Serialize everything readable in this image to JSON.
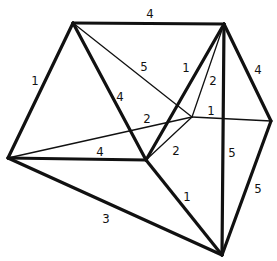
{
  "diagram": {
    "vertices": [
      {
        "id": "A",
        "x": 73,
        "y": 23
      },
      {
        "id": "B",
        "x": 224,
        "y": 24
      },
      {
        "id": "C",
        "x": 8,
        "y": 158
      },
      {
        "id": "D",
        "x": 146,
        "y": 160
      },
      {
        "id": "E",
        "x": 192,
        "y": 117
      },
      {
        "id": "F",
        "x": 271,
        "y": 121
      },
      {
        "id": "G",
        "x": 222,
        "y": 255
      }
    ],
    "edges": [
      {
        "from": "A",
        "to": "B",
        "weight": "4",
        "style": "thick",
        "lx": 150,
        "ly": 18
      },
      {
        "from": "A",
        "to": "C",
        "weight": "1",
        "style": "thick",
        "lx": 35,
        "ly": 85
      },
      {
        "from": "A",
        "to": "D",
        "weight": "4",
        "style": "thick",
        "lx": 120,
        "ly": 101
      },
      {
        "from": "A",
        "to": "E",
        "weight": "5",
        "style": "thin",
        "lx": 144,
        "ly": 71
      },
      {
        "from": "B",
        "to": "D",
        "weight": "1",
        "style": "thick",
        "lx": 186,
        "ly": 72
      },
      {
        "from": "B",
        "to": "E",
        "weight": "2",
        "style": "thin",
        "lx": 213,
        "ly": 85
      },
      {
        "from": "B",
        "to": "F",
        "weight": "4",
        "style": "thick",
        "lx": 258,
        "ly": 74
      },
      {
        "from": "B",
        "to": "G",
        "weight": "5",
        "style": "thick",
        "lx": 232,
        "ly": 157
      },
      {
        "from": "C",
        "to": "E",
        "weight": "2",
        "style": "thin",
        "lx": 147,
        "ly": 123
      },
      {
        "from": "C",
        "to": "D",
        "weight": "4",
        "style": "thick",
        "lx": 100,
        "ly": 156
      },
      {
        "from": "C",
        "to": "G",
        "weight": "3",
        "style": "thick",
        "lx": 106,
        "ly": 223
      },
      {
        "from": "D",
        "to": "E",
        "weight": "2",
        "style": "thin",
        "lx": 176,
        "ly": 155
      },
      {
        "from": "D",
        "to": "G",
        "weight": "1",
        "style": "thick",
        "lx": 187,
        "ly": 201
      },
      {
        "from": "E",
        "to": "F",
        "weight": "1",
        "style": "thin",
        "lx": 211,
        "ly": 115
      },
      {
        "from": "F",
        "to": "G",
        "weight": "5",
        "style": "thick",
        "lx": 258,
        "ly": 193
      }
    ]
  }
}
